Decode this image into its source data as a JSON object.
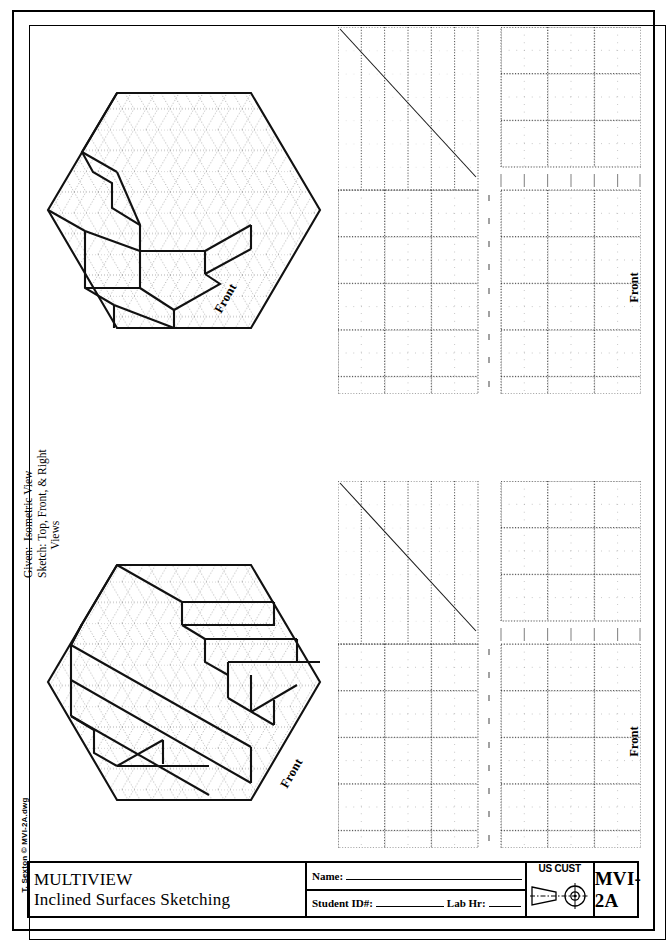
{
  "sheet": {
    "copyright": "T. Sexton  © MVI-2A.dwg"
  },
  "instructions": {
    "text": "Given:  Isometric View\nSketch: Top, Front, & Right\n          Views"
  },
  "isometric_views": [
    {
      "id": "problem-1",
      "front_label": "Front"
    },
    {
      "id": "problem-2",
      "front_label": "Front"
    }
  ],
  "multiview_grids": [
    {
      "id": "grid-1",
      "front_label": "Front",
      "miter_line": true
    },
    {
      "id": "grid-2",
      "front_label": "Front",
      "miter_line": true
    }
  ],
  "title_block": {
    "title_line1": "MULTIVIEW",
    "title_line2": "Inclined Surfaces Sketching",
    "name_label": "Name:",
    "student_id_label": "Student ID#:",
    "lab_hr_label": "Lab Hr:",
    "units_label": "US CUST",
    "projection_symbol": "third-angle-projection",
    "drawing_number": "MVI-2A"
  }
}
